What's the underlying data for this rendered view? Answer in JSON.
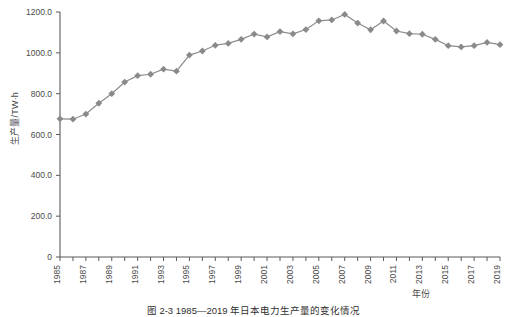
{
  "figure": {
    "caption": "图 2-3   1985—2019 年日本电力生产量的变化情况",
    "ylabel": "生产量/TW·h",
    "xlabel": "年份"
  },
  "chart_data": {
    "type": "line",
    "title": "",
    "xlabel": "年份",
    "ylabel": "生产量/TW·h",
    "xlim": [
      1985,
      2019
    ],
    "ylim": [
      0,
      1200
    ],
    "ytick_labels": [
      "0",
      "200.0",
      "400.0",
      "600.0",
      "800.0",
      "1000.0",
      "1200.0"
    ],
    "ytick_values": [
      0,
      200,
      400,
      600,
      800,
      1000,
      1200
    ],
    "xtick_labels": [
      "1985",
      "1987",
      "1989",
      "1991",
      "1993",
      "1995",
      "1997",
      "1999",
      "2001",
      "2003",
      "2005",
      "2007",
      "2009",
      "2011",
      "2013",
      "2015",
      "2017",
      "2019"
    ],
    "xtick_values": [
      1985,
      1987,
      1989,
      1991,
      1993,
      1995,
      1997,
      1999,
      2001,
      2003,
      2005,
      2007,
      2009,
      2011,
      2013,
      2015,
      2017,
      2019
    ],
    "minor_xticks_every": 1,
    "grid": false,
    "legend": false,
    "marker": "diamond",
    "line_color": "#8c8c8c",
    "marker_color": "#8a8a8a",
    "x": [
      1985,
      1986,
      1987,
      1988,
      1989,
      1990,
      1991,
      1992,
      1993,
      1994,
      1995,
      1996,
      1997,
      1998,
      1999,
      2000,
      2001,
      2002,
      2003,
      2004,
      2005,
      2006,
      2007,
      2008,
      2009,
      2010,
      2011,
      2012,
      2013,
      2014,
      2015,
      2016,
      2017,
      2018,
      2019
    ],
    "values": [
      677,
      675,
      700,
      753,
      800,
      857,
      888,
      895,
      920,
      910,
      989,
      1009,
      1037,
      1046,
      1066,
      1092,
      1078,
      1104,
      1093,
      1114,
      1157,
      1161,
      1188,
      1146,
      1113,
      1156,
      1107,
      1094,
      1091,
      1066,
      1035,
      1029,
      1035,
      1051,
      1040
    ],
    "series": [
      {
        "name": "生产量",
        "values": [
          677,
          675,
          700,
          753,
          800,
          857,
          888,
          895,
          920,
          910,
          989,
          1009,
          1037,
          1046,
          1066,
          1092,
          1078,
          1104,
          1093,
          1114,
          1157,
          1161,
          1188,
          1146,
          1113,
          1156,
          1107,
          1094,
          1091,
          1066,
          1035,
          1029,
          1035,
          1051,
          1040
        ]
      }
    ],
    "annotations": []
  }
}
